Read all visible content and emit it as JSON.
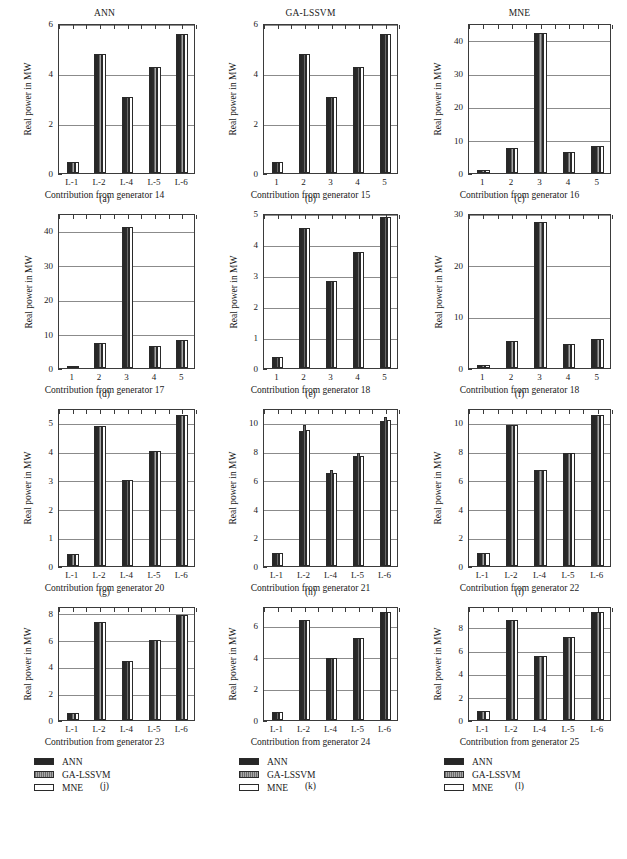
{
  "figure": {
    "series_names": [
      "ANN",
      "GA-LSSVM",
      "MNE"
    ],
    "series_colors": [
      "#272727",
      "#7d7d7d",
      "#ffffff"
    ],
    "ylabel": "Real power in MW",
    "legend_labels": [
      "ANN",
      "GA-LSSVM",
      "MNE"
    ]
  },
  "chart_data": [
    {
      "type": "bar",
      "panel": "(a)",
      "title": "ANN",
      "xlabel": "Contribution from generator 14",
      "ylabel": "Real power in MW",
      "categories": [
        "L-1",
        "L-2",
        "L-4",
        "L-5",
        "L-6"
      ],
      "series": [
        {
          "name": "ANN",
          "values": [
            0.45,
            4.78,
            3.05,
            4.25,
            5.55
          ]
        },
        {
          "name": "GA-LSSVM",
          "values": [
            0.45,
            4.78,
            3.05,
            4.25,
            5.55
          ]
        },
        {
          "name": "MNE",
          "values": [
            0.45,
            4.78,
            3.05,
            4.25,
            5.55
          ]
        }
      ],
      "ylim": [
        0,
        6
      ],
      "yticks": [
        0,
        2,
        4,
        6
      ],
      "grid": true,
      "legend": "none"
    },
    {
      "type": "bar",
      "panel": "(b)",
      "title": "GA-LSSVM",
      "xlabel": "Contribution from generator 15",
      "ylabel": "Real power in MW",
      "categories": [
        "1",
        "2",
        "3",
        "4",
        "5"
      ],
      "series": [
        {
          "name": "ANN",
          "values": [
            0.45,
            4.78,
            3.05,
            4.25,
            5.55
          ]
        },
        {
          "name": "GA-LSSVM",
          "values": [
            0.45,
            4.78,
            3.05,
            4.25,
            5.55
          ]
        },
        {
          "name": "MNE",
          "values": [
            0.45,
            4.78,
            3.05,
            4.25,
            5.55
          ]
        }
      ],
      "ylim": [
        0,
        6
      ],
      "yticks": [
        0,
        2,
        4,
        6
      ],
      "grid": true,
      "legend": "none"
    },
    {
      "type": "bar",
      "panel": "(c)",
      "title": "MNE",
      "xlabel": "Contribution from generator 16",
      "ylabel": "Real power in MW",
      "categories": [
        "1",
        "2",
        "3",
        "4",
        "5"
      ],
      "series": [
        {
          "name": "ANN",
          "values": [
            0.9,
            7.4,
            42.0,
            6.3,
            8.2
          ]
        },
        {
          "name": "GA-LSSVM",
          "values": [
            0.9,
            7.4,
            42.0,
            6.3,
            8.2
          ]
        },
        {
          "name": "MNE",
          "values": [
            0.9,
            7.4,
            42.0,
            6.3,
            8.2
          ]
        }
      ],
      "ylim": [
        0,
        45
      ],
      "yticks": [
        0,
        10,
        20,
        30,
        40
      ],
      "grid": true,
      "legend": "none"
    },
    {
      "type": "bar",
      "panel": "(d)",
      "title": "",
      "xlabel": "Contribution from generator 17",
      "ylabel": "Real power in MW",
      "categories": [
        "1",
        "2",
        "3",
        "4",
        "5"
      ],
      "series": [
        {
          "name": "ANN",
          "values": [
            0.7,
            7.4,
            41.0,
            6.3,
            8.1
          ]
        },
        {
          "name": "GA-LSSVM",
          "values": [
            0.7,
            7.4,
            41.0,
            6.3,
            8.1
          ]
        },
        {
          "name": "MNE",
          "values": [
            0.7,
            7.4,
            41.0,
            6.3,
            8.1
          ]
        }
      ],
      "ylim": [
        0,
        45
      ],
      "yticks": [
        0,
        10,
        20,
        30,
        40
      ],
      "grid": true,
      "legend": "none"
    },
    {
      "type": "bar",
      "panel": "(e)",
      "title": "",
      "xlabel": "Contribution from generator 18",
      "ylabel": "Real power in MW",
      "categories": [
        "1",
        "2",
        "3",
        "4",
        "5"
      ],
      "series": [
        {
          "name": "ANN",
          "values": [
            0.35,
            4.52,
            2.82,
            3.75,
            4.88
          ]
        },
        {
          "name": "GA-LSSVM",
          "values": [
            0.35,
            4.52,
            2.82,
            3.75,
            4.88
          ]
        },
        {
          "name": "MNE",
          "values": [
            0.35,
            4.52,
            2.82,
            3.75,
            4.88
          ]
        }
      ],
      "ylim": [
        0,
        5
      ],
      "yticks": [
        0,
        1,
        2,
        3,
        4,
        5
      ],
      "grid": true,
      "legend": "none"
    },
    {
      "type": "bar",
      "panel": "(f)",
      "title": "",
      "xlabel": "Contribution from generator 18",
      "ylabel": "Real power in MW",
      "categories": [
        "1",
        "2",
        "3",
        "4",
        "5"
      ],
      "series": [
        {
          "name": "ANN",
          "values": [
            0.6,
            5.2,
            28.2,
            4.6,
            5.7
          ]
        },
        {
          "name": "GA-LSSVM",
          "values": [
            0.6,
            5.2,
            28.2,
            4.6,
            5.7
          ]
        },
        {
          "name": "MNE",
          "values": [
            0.6,
            5.2,
            28.2,
            4.6,
            5.7
          ]
        }
      ],
      "ylim": [
        0,
        30
      ],
      "yticks": [
        0,
        10,
        20,
        30
      ],
      "grid": true,
      "legend": "none"
    },
    {
      "type": "bar",
      "panel": "(g)",
      "title": "",
      "xlabel": "Contribution from generator 20",
      "ylabel": "Real power in MW",
      "categories": [
        "L-1",
        "L-2",
        "L-4",
        "L-5",
        "L-6"
      ],
      "series": [
        {
          "name": "ANN",
          "values": [
            0.42,
            4.88,
            3.0,
            4.0,
            5.25
          ]
        },
        {
          "name": "GA-LSSVM",
          "values": [
            0.42,
            4.88,
            3.0,
            4.0,
            5.25
          ]
        },
        {
          "name": "MNE",
          "values": [
            0.42,
            4.88,
            3.0,
            4.0,
            5.25
          ]
        }
      ],
      "ylim": [
        0,
        5.5
      ],
      "yticks": [
        0,
        1,
        2,
        3,
        4,
        5
      ],
      "grid": true,
      "legend": "none"
    },
    {
      "type": "bar",
      "panel": "(h)",
      "title": "",
      "xlabel": "Contribution from generator 21",
      "ylabel": "Real power in MW",
      "categories": [
        "L-1",
        "L-2",
        "L-4",
        "L-5",
        "L-6"
      ],
      "series": [
        {
          "name": "ANN",
          "values": [
            0.9,
            9.4,
            6.45,
            7.65,
            10.1
          ]
        },
        {
          "name": "GA-LSSVM",
          "values": [
            0.9,
            9.8,
            6.65,
            7.9,
            10.4
          ]
        },
        {
          "name": "MNE",
          "values": [
            0.9,
            9.45,
            6.5,
            7.65,
            10.15
          ]
        }
      ],
      "ylim": [
        0,
        11
      ],
      "yticks": [
        0,
        2,
        4,
        6,
        8,
        10
      ],
      "grid": true,
      "legend": "none"
    },
    {
      "type": "bar",
      "panel": "(i)",
      "title": "",
      "xlabel": "Contribution from generator 22",
      "ylabel": "Real power in MW",
      "categories": [
        "L-1",
        "L-2",
        "L-4",
        "L-5",
        "L-6"
      ],
      "series": [
        {
          "name": "ANN",
          "values": [
            0.9,
            9.8,
            6.7,
            7.9,
            10.5
          ]
        },
        {
          "name": "GA-LSSVM",
          "values": [
            0.9,
            9.8,
            6.7,
            7.9,
            10.5
          ]
        },
        {
          "name": "MNE",
          "values": [
            0.9,
            9.8,
            6.7,
            7.9,
            10.5
          ]
        }
      ],
      "ylim": [
        0,
        11
      ],
      "yticks": [
        0,
        2,
        4,
        6,
        8,
        10
      ],
      "grid": true,
      "legend": "none"
    },
    {
      "type": "bar",
      "panel": "(j)",
      "title": "",
      "xlabel": "Contribution from generator 23",
      "ylabel": "Real power in MW",
      "categories": [
        "L-1",
        "L-2",
        "L-4",
        "L-5",
        "L-6"
      ],
      "series": [
        {
          "name": "ANN",
          "values": [
            0.55,
            7.3,
            4.4,
            6.0,
            7.85
          ]
        },
        {
          "name": "GA-LSSVM",
          "values": [
            0.55,
            7.3,
            4.4,
            6.0,
            7.85
          ]
        },
        {
          "name": "MNE",
          "values": [
            0.55,
            7.3,
            4.4,
            6.0,
            7.85
          ]
        }
      ],
      "ylim": [
        0,
        8.5
      ],
      "yticks": [
        0,
        2,
        4,
        6,
        8
      ],
      "grid": true,
      "legend": "bottom"
    },
    {
      "type": "bar",
      "panel": "(k)",
      "title": "",
      "xlabel": "Contribution from generator 24",
      "ylabel": "Real power in MW",
      "categories": [
        "L-1",
        "L-2",
        "L-4",
        "L-5",
        "L-6"
      ],
      "series": [
        {
          "name": "ANN",
          "values": [
            0.52,
            6.3,
            3.9,
            5.2,
            6.85
          ]
        },
        {
          "name": "GA-LSSVM",
          "values": [
            0.52,
            6.3,
            3.9,
            5.2,
            6.85
          ]
        },
        {
          "name": "MNE",
          "values": [
            0.52,
            6.3,
            3.9,
            5.2,
            6.85
          ]
        }
      ],
      "ylim": [
        0,
        7.2
      ],
      "yticks": [
        0,
        2,
        4,
        6
      ],
      "grid": true,
      "legend": "bottom"
    },
    {
      "type": "bar",
      "panel": "(l)",
      "title": "",
      "xlabel": "Contribution from generator 25",
      "ylabel": "Real power in MW",
      "categories": [
        "L-1",
        "L-2",
        "L-4",
        "L-5",
        "L-6"
      ],
      "series": [
        {
          "name": "ANN",
          "values": [
            0.75,
            8.6,
            5.5,
            7.15,
            9.3
          ]
        },
        {
          "name": "GA-LSSVM",
          "values": [
            0.75,
            8.6,
            5.5,
            7.15,
            9.3
          ]
        },
        {
          "name": "MNE",
          "values": [
            0.75,
            8.6,
            5.5,
            7.15,
            9.3
          ]
        }
      ],
      "ylim": [
        0,
        9.8
      ],
      "yticks": [
        0,
        2,
        4,
        6,
        8
      ],
      "grid": true,
      "legend": "bottom"
    }
  ]
}
